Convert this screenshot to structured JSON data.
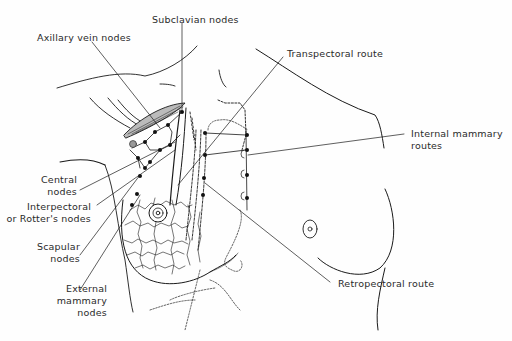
{
  "figure": {
    "labels": {
      "subclavian": "Subclavian nodes",
      "axillary_vein": "Axillary vein nodes",
      "transpectoral": "Transpectoral route",
      "internal_mammary_1": "Internal mammary",
      "internal_mammary_2": "routes",
      "central_1": "Central",
      "central_2": "nodes",
      "interpectoral_1": "Interpectoral",
      "interpectoral_2": "or Rotter's nodes",
      "scapular_1": "Scapular",
      "scapular_2": "nodes",
      "external_1": "External",
      "external_2": "mammary",
      "external_3": "nodes",
      "retropectoral": "Retropectoral route"
    },
    "colors": {
      "ink": "#1a1a1a",
      "background": "#fefefe"
    }
  }
}
